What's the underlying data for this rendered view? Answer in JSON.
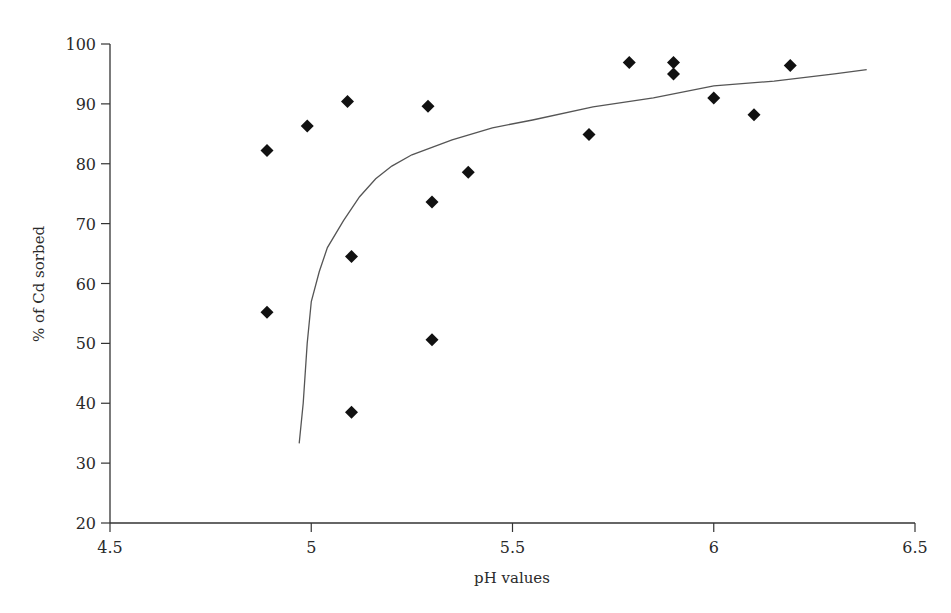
{
  "chart_data": {
    "type": "scatter",
    "title": "",
    "xlabel": "pH values",
    "ylabel": "% of Cd sorbed",
    "xlim": [
      4.5,
      6.5
    ],
    "ylim": [
      20,
      100
    ],
    "x_ticks": [
      4.5,
      5,
      5.5,
      6,
      6.5
    ],
    "x_tick_labels": [
      "4.5",
      "5",
      "5.5",
      "6",
      "6.5"
    ],
    "y_ticks": [
      20,
      30,
      40,
      50,
      60,
      70,
      80,
      90,
      100
    ],
    "y_tick_labels": [
      "20",
      "30",
      "40",
      "50",
      "60",
      "70",
      "80",
      "90",
      "100"
    ],
    "grid": false,
    "legend": null,
    "series": [
      {
        "name": "Observed",
        "marker": "diamond",
        "color": "#111111",
        "points": [
          {
            "x": 4.89,
            "y": 82.2
          },
          {
            "x": 4.89,
            "y": 55.2
          },
          {
            "x": 4.99,
            "y": 86.3
          },
          {
            "x": 5.09,
            "y": 90.4
          },
          {
            "x": 5.1,
            "y": 64.5
          },
          {
            "x": 5.1,
            "y": 38.5
          },
          {
            "x": 5.29,
            "y": 89.6
          },
          {
            "x": 5.3,
            "y": 73.6
          },
          {
            "x": 5.3,
            "y": 50.6
          },
          {
            "x": 5.39,
            "y": 78.6
          },
          {
            "x": 5.69,
            "y": 84.9
          },
          {
            "x": 5.79,
            "y": 96.9
          },
          {
            "x": 5.9,
            "y": 96.9
          },
          {
            "x": 5.9,
            "y": 95.0
          },
          {
            "x": 6.0,
            "y": 91.0
          },
          {
            "x": 6.1,
            "y": 88.2
          },
          {
            "x": 6.19,
            "y": 96.4
          }
        ]
      },
      {
        "name": "Fitted curve",
        "type": "line",
        "color": "#555555",
        "points": [
          {
            "x": 4.97,
            "y": 33.3
          },
          {
            "x": 4.98,
            "y": 40.0
          },
          {
            "x": 4.99,
            "y": 50.0
          },
          {
            "x": 5.0,
            "y": 57.0
          },
          {
            "x": 5.02,
            "y": 62.0
          },
          {
            "x": 5.04,
            "y": 66.0
          },
          {
            "x": 5.08,
            "y": 70.5
          },
          {
            "x": 5.12,
            "y": 74.5
          },
          {
            "x": 5.16,
            "y": 77.5
          },
          {
            "x": 5.2,
            "y": 79.6
          },
          {
            "x": 5.25,
            "y": 81.5
          },
          {
            "x": 5.35,
            "y": 84.0
          },
          {
            "x": 5.45,
            "y": 86.0
          },
          {
            "x": 5.55,
            "y": 87.3
          },
          {
            "x": 5.7,
            "y": 89.5
          },
          {
            "x": 5.85,
            "y": 91.0
          },
          {
            "x": 6.0,
            "y": 93.0
          },
          {
            "x": 6.15,
            "y": 93.8
          },
          {
            "x": 6.3,
            "y": 95.0
          },
          {
            "x": 6.38,
            "y": 95.7
          }
        ]
      }
    ]
  },
  "layout": {
    "plot_left": 110,
    "plot_right": 915,
    "plot_top": 44,
    "plot_bottom": 523
  }
}
